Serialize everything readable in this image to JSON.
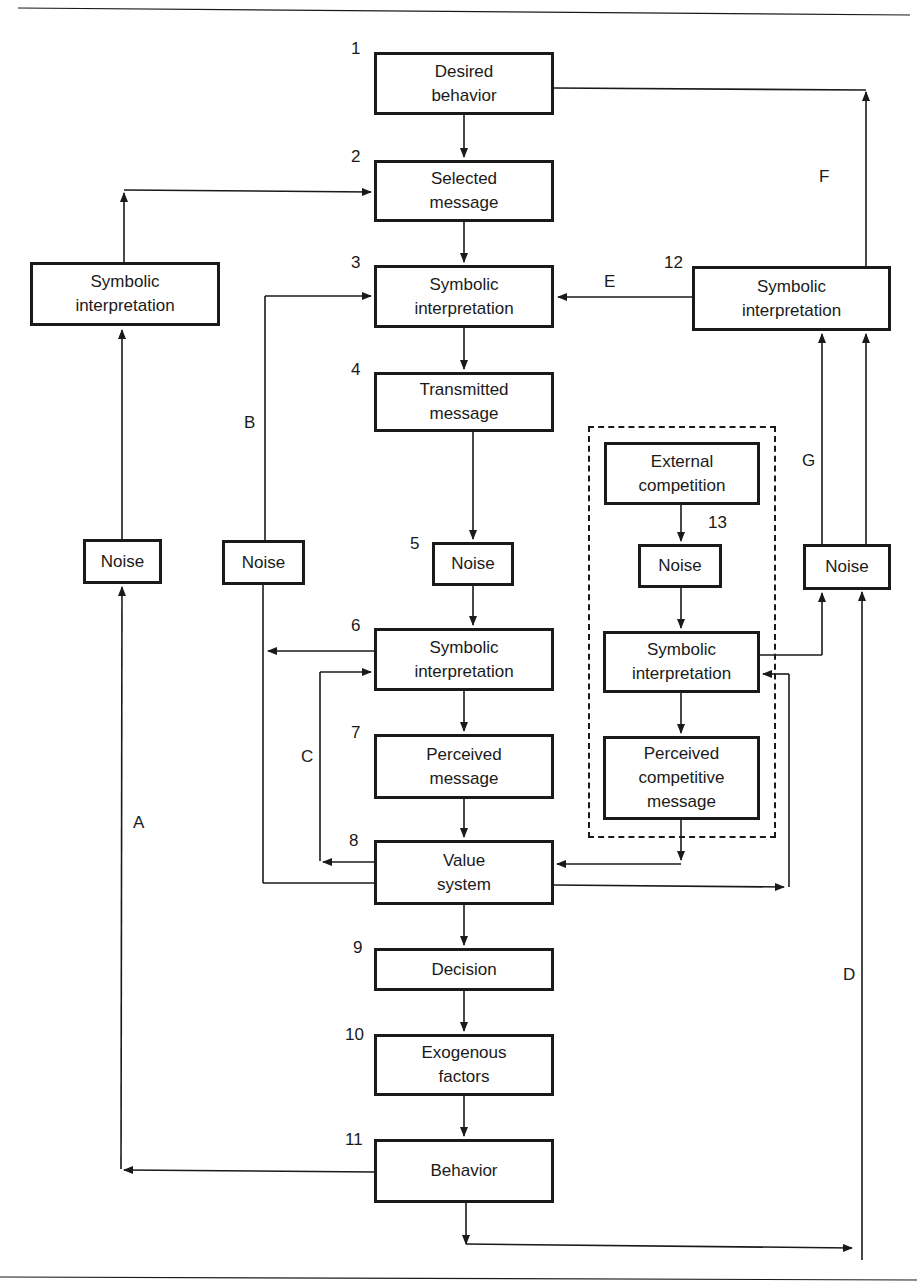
{
  "figure": {
    "nodes": [
      {
        "id": "1",
        "number": "1",
        "label": "Desired\nbehavior"
      },
      {
        "id": "2",
        "number": "2",
        "label": "Selected\nmessage"
      },
      {
        "id": "3",
        "number": "3",
        "label": "Symbolic\ninterpretation"
      },
      {
        "id": "4",
        "number": "4",
        "label": "Transmitted\nmessage"
      },
      {
        "id": "5",
        "number": "5",
        "label": "Noise"
      },
      {
        "id": "6",
        "number": "6",
        "label": "Symbolic\ninterpretation"
      },
      {
        "id": "7",
        "number": "7",
        "label": "Perceived\nmessage"
      },
      {
        "id": "8",
        "number": "8",
        "label": "Value\nsystem"
      },
      {
        "id": "9",
        "number": "9",
        "label": "Decision"
      },
      {
        "id": "10",
        "number": "10",
        "label": "Exogenous\nfactors"
      },
      {
        "id": "11",
        "number": "11",
        "label": "Behavior"
      },
      {
        "id": "12",
        "number": "12",
        "label": "Symbolic\ninterpretation"
      },
      {
        "id": "13-ext",
        "number": "13",
        "label": "External\ncompetition"
      },
      {
        "id": "13-noise",
        "label": "Noise"
      },
      {
        "id": "13-sym",
        "label": "Symbolic\ninterpretation"
      },
      {
        "id": "13-perc",
        "label": "Perceived\ncompetitive\nmessage"
      },
      {
        "id": "left-sym",
        "label": "Symbolic\ninterpretation"
      },
      {
        "id": "noise-a",
        "label": "Noise"
      },
      {
        "id": "noise-b",
        "label": "Noise"
      },
      {
        "id": "noise-g",
        "label": "Noise"
      }
    ],
    "path_labels": {
      "A": "A",
      "B": "B",
      "C": "C",
      "D": "D",
      "E": "E",
      "F": "F",
      "G": "G"
    }
  }
}
